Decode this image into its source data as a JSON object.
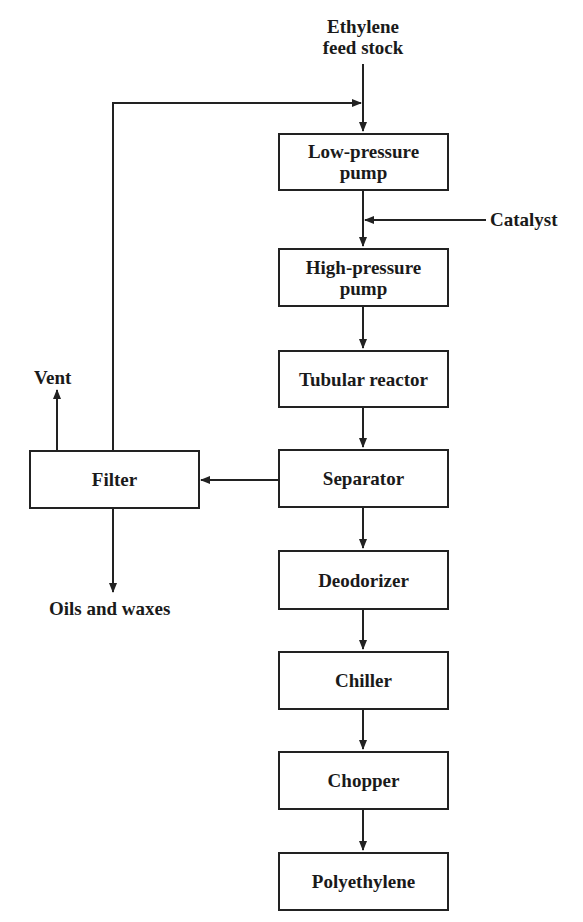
{
  "diagram": {
    "type": "process-flow",
    "inputs": {
      "feed": "Ethylene feed stock",
      "feed_line1": "Ethylene",
      "feed_line2": "feed stock",
      "catalyst": "Catalyst"
    },
    "steps": [
      {
        "id": "low_pressure_pump",
        "line1": "Low-pressure",
        "line2": "pump"
      },
      {
        "id": "high_pressure_pump",
        "line1": "High-pressure",
        "line2": "pump"
      },
      {
        "id": "tubular_reactor",
        "line1": "Tubular reactor"
      },
      {
        "id": "separator",
        "line1": "Separator"
      },
      {
        "id": "deodorizer",
        "line1": "Deodorizer"
      },
      {
        "id": "chiller",
        "line1": "Chiller"
      },
      {
        "id": "chopper",
        "line1": "Chopper"
      },
      {
        "id": "polyethylene",
        "line1": "Polyethylene"
      }
    ],
    "side_unit": {
      "id": "filter",
      "label": "Filter"
    },
    "outputs": {
      "vent": "Vent",
      "oils": "Oils and waxes"
    },
    "edges": [
      [
        "Ethylene feed stock",
        "Low-pressure pump"
      ],
      [
        "Filter",
        "Low-pressure pump (recycle)"
      ],
      [
        "Low-pressure pump",
        "High-pressure pump"
      ],
      [
        "Catalyst",
        "High-pressure pump"
      ],
      [
        "High-pressure pump",
        "Tubular reactor"
      ],
      [
        "Tubular reactor",
        "Separator"
      ],
      [
        "Separator",
        "Filter"
      ],
      [
        "Filter",
        "Vent"
      ],
      [
        "Filter",
        "Oils and waxes"
      ],
      [
        "Separator",
        "Deodorizer"
      ],
      [
        "Deodorizer",
        "Chiller"
      ],
      [
        "Chiller",
        "Chopper"
      ],
      [
        "Chopper",
        "Polyethylene"
      ]
    ]
  }
}
